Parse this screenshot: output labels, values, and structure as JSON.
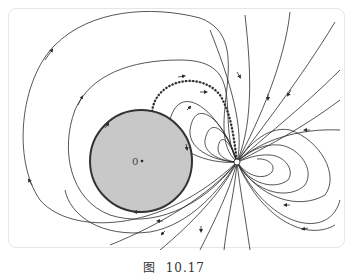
{
  "figure": {
    "caption_prefix": "图",
    "caption_number": "10.17",
    "disk_label": "0",
    "colors": {
      "disk_fill": "#c8c8c8",
      "disk_stroke": "#333333",
      "line": "#2b2b2b",
      "frame": "#e6e6e6"
    },
    "disk": {
      "cx": 141,
      "cy": 161,
      "r": 51
    },
    "singularity": {
      "cx": 237,
      "cy": 162,
      "r": 3
    }
  }
}
